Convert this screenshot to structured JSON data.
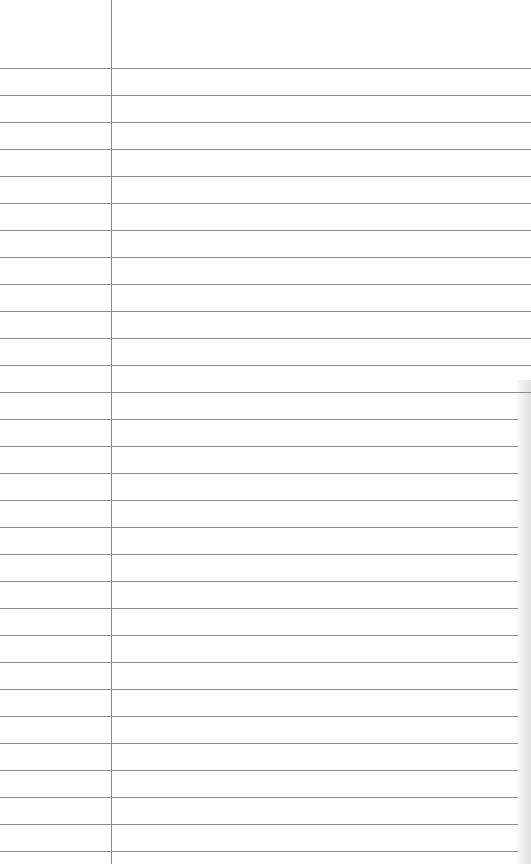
{
  "page": {
    "type": "lined-notepad-sheet",
    "background_color": "#fefefe",
    "rule_color": "#8c8c8c",
    "margin_color": "#8a8a8a",
    "margin_x": 111,
    "first_line_y": 68,
    "line_spacing": 27.0,
    "line_count": 30,
    "text": ""
  }
}
